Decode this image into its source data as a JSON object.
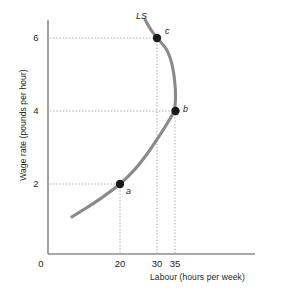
{
  "chart_data": {
    "type": "line",
    "title": "",
    "subtitle": "",
    "xlabel": "Labour (hours per week)",
    "ylabel": "Wage rate (pounds per hour)",
    "xlim": [
      0,
      45
    ],
    "ylim": [
      0,
      7
    ],
    "grid": false,
    "legend_position": "none",
    "curve_label": "LS",
    "curve_name": "Labour supply curve (backward bending)",
    "curve_color": "#8a8a8a",
    "origin_label": "0",
    "x_ticks": [
      {
        "value": 20,
        "label": "20"
      },
      {
        "value": 30,
        "label": "30"
      },
      {
        "value": 35,
        "label": "35"
      }
    ],
    "y_ticks": [
      {
        "value": 2,
        "label": "2"
      },
      {
        "value": 4,
        "label": "4"
      },
      {
        "value": 6,
        "label": "6"
      }
    ],
    "series": [
      {
        "name": "LS",
        "points": [
          {
            "x": 7,
            "y": 1.1
          },
          {
            "x": 11,
            "y": 1.35
          },
          {
            "x": 15,
            "y": 1.62
          },
          {
            "x": 20,
            "y": 2.0
          },
          {
            "x": 24,
            "y": 2.4
          },
          {
            "x": 27.5,
            "y": 2.85
          },
          {
            "x": 30.5,
            "y": 3.3
          },
          {
            "x": 33,
            "y": 3.7
          },
          {
            "x": 34.6,
            "y": 4.0
          },
          {
            "x": 35,
            "y": 4.35
          },
          {
            "x": 34.8,
            "y": 4.8
          },
          {
            "x": 34.0,
            "y": 5.3
          },
          {
            "x": 32.5,
            "y": 5.7
          },
          {
            "x": 30,
            "y": 6.0
          },
          {
            "x": 28.2,
            "y": 6.25
          },
          {
            "x": 26.8,
            "y": 6.5
          }
        ]
      }
    ],
    "annotated_points": [
      {
        "id": "a",
        "label": "a",
        "x": 20,
        "y": 2,
        "marker": "filled-circle"
      },
      {
        "id": "b",
        "label": "b",
        "x": 35,
        "y": 4,
        "marker": "filled-circle"
      },
      {
        "id": "c",
        "label": "c",
        "x": 30,
        "y": 6,
        "marker": "filled-circle"
      }
    ],
    "dropline_color": "#a9a9a9",
    "axis_color": "#808080"
  }
}
